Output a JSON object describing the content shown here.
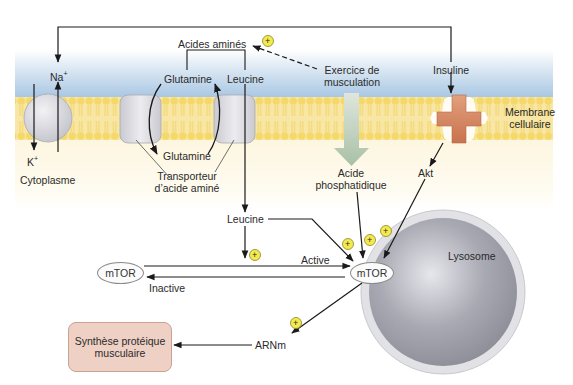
{
  "colors": {
    "extracellular_top": "#ffffff",
    "extracellular_blue": "#a9c9e6",
    "membrane": "#f4d978",
    "membrane_head": "#f7e08a",
    "cytoplasm": "#fdf8e6",
    "transporter": "#d9d9de",
    "insulin_receptor": "#d98a62",
    "lysosome_outer": "#d7d7dd",
    "lysosome_inner": "#9b9ba6",
    "synthesis_box": "#efd0c4",
    "plus_badge": "#f4ea50",
    "arrow_green": "#b9ccb7"
  },
  "labels": {
    "na": "Na",
    "na_sup": "+",
    "k": "K",
    "k_sup": "+",
    "cytoplasm": "Cytoplasme",
    "amino_acids": "Acides aminés",
    "glutamine_top": "Glutamine",
    "leucine_top": "Leucine",
    "glutamine_bottom": "Glutamine",
    "transporter_line1": "Transporteur",
    "transporter_line2": "d’acide aminé",
    "exercise_line1": "Exercice de",
    "exercise_line2": "musculation",
    "insulin": "Insuline",
    "membrane_line1": "Membrane",
    "membrane_line2": "cellulaire",
    "phosphatidic_line1": "Acide",
    "phosphatidic_line2": "phosphatidique",
    "akt": "Akt",
    "leucine_mid": "Leucine",
    "active": "Active",
    "inactive": "Inactive",
    "mtor_inactive": "mTOR",
    "mtor_active": "mTOR",
    "lysosome": "Lysosome",
    "arnm": "ARNm",
    "synthesis_line1": "Synthèse protéique",
    "synthesis_line2": "musculaire",
    "plus": "+"
  }
}
